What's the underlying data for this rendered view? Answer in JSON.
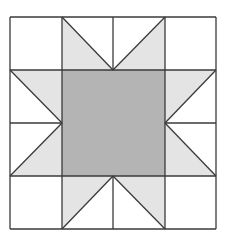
{
  "diagram": {
    "type": "quilt-block",
    "pattern": "sawtooth star (ohio-star variant)",
    "grid": {
      "x": [
        10,
        62,
        113,
        165,
        216
      ],
      "y": [
        17,
        70,
        123,
        176,
        229
      ]
    },
    "colors": {
      "background": "#ffffff",
      "center": "#b4b4b4",
      "points": "#e4e4e4",
      "stroke": "#3a3a3a"
    },
    "center_square": {
      "x": 62,
      "y": 70,
      "w": 103,
      "h": 106
    },
    "star_points": [
      {
        "name": "top-left-point",
        "points": "62,17 62,70 113,70"
      },
      {
        "name": "top-right-point",
        "points": "165,17 165,70 113,70"
      },
      {
        "name": "left-top-point",
        "points": "10,70 62,70 62,123"
      },
      {
        "name": "left-bottom-point",
        "points": "62,123 62,176 10,176"
      },
      {
        "name": "bottom-left-point",
        "points": "62,176 113,176 62,229"
      },
      {
        "name": "bottom-right-point",
        "points": "113,176 165,176 165,229"
      },
      {
        "name": "right-top-point",
        "points": "165,70 216,70 165,123"
      },
      {
        "name": "right-bottom-point",
        "points": "165,123 165,176 216,176"
      }
    ]
  }
}
